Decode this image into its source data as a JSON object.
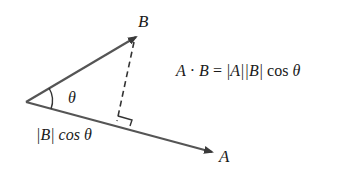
{
  "diagram": {
    "vectors": [
      {
        "name": "B",
        "label": "B",
        "from": [
          26,
          102
        ],
        "to": [
          137,
          36
        ]
      },
      {
        "name": "A",
        "label": "A",
        "from": [
          26,
          102
        ],
        "to": [
          213,
          152
        ]
      }
    ],
    "angle_label": "θ",
    "projection_label_parts": [
      "|B|",
      " cos ",
      "θ"
    ],
    "formula": {
      "lhs_a": "A",
      "dot": "·",
      "lhs_b": "B",
      "equals": "=",
      "rhs_abs_a": "|A|",
      "rhs_abs_b": "|B|",
      "rhs_cos": "cos",
      "rhs_theta": "θ"
    },
    "colors": {
      "line": "#555555",
      "text": "#1a1a1a",
      "background": "#ffffff"
    }
  }
}
